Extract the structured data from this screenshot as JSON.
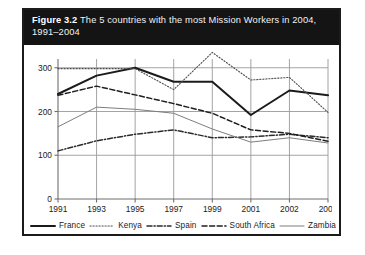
{
  "figure": {
    "label": "Figure 3.2",
    "caption": "The 5 countries with the most Mission Workers in 2004, 1991–2004"
  },
  "colors": {
    "banner_background": "#141414",
    "banner_text": "#ffffff",
    "frame_border": "#1b1b1b",
    "grid": "#9a9a9a",
    "axis": "#6f6f6f",
    "france": "#1b1b1b",
    "kenya": "#4d4d4d",
    "spain": "#2b2b2b",
    "south_africa": "#1f1f1f",
    "zambia": "#7d7d7d"
  },
  "chart_data": {
    "type": "line",
    "title": "The 5 countries with the most Mission Workers in 2004, 1991–2004",
    "xlabel": "",
    "ylabel": "",
    "xlim": [
      1991,
      2004
    ],
    "ylim": [
      0,
      320
    ],
    "grid": true,
    "legend_position": "bottom",
    "x": [
      1991,
      1993,
      1995,
      1997,
      1999,
      2001,
      2002,
      2004
    ],
    "categories": [
      "1991",
      "1993",
      "1995",
      "1997",
      "1999",
      "2001",
      "2002",
      "2004"
    ],
    "ytick_labels": [
      "0",
      "100",
      "200",
      "300"
    ],
    "yticks": [
      0,
      100,
      200,
      300
    ],
    "series": [
      {
        "name": "France",
        "style": "solid-thick",
        "values": [
          240,
          282,
          300,
          268,
          268,
          192,
          248,
          237
        ]
      },
      {
        "name": "Kenya",
        "style": "dotted",
        "values": [
          298,
          298,
          298,
          250,
          335,
          272,
          278,
          198
        ]
      },
      {
        "name": "Spain",
        "style": "dash-dot",
        "values": [
          110,
          133,
          148,
          158,
          140,
          142,
          148,
          140
        ]
      },
      {
        "name": "South Africa",
        "style": "dashed",
        "values": [
          237,
          258,
          238,
          218,
          196,
          158,
          150,
          132
        ]
      },
      {
        "name": "Zambia",
        "style": "solid-thin",
        "values": [
          165,
          210,
          205,
          196,
          160,
          130,
          140,
          128
        ]
      }
    ]
  },
  "legend": {
    "items": [
      {
        "label": "France",
        "style": "solid-thick"
      },
      {
        "label": "Kenya",
        "style": "dotted"
      },
      {
        "label": "Spain",
        "style": "dash-dot"
      },
      {
        "label": "South Africa",
        "style": "dashed"
      },
      {
        "label": "Zambia",
        "style": "solid-thin"
      }
    ]
  }
}
